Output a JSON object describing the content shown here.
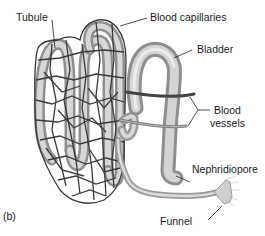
{
  "diagram": {
    "panel_label": "(b)",
    "labels": {
      "tubule": "Tubule",
      "blood_capillaries": "Blood capillaries",
      "bladder": "Bladder",
      "blood_vessels_line1": "Blood",
      "blood_vessels_line2": "vessels",
      "nephridiopore": "Nephridiopore",
      "funnel": "Funnel"
    },
    "colors": {
      "tube_fill": "#c8c8c8",
      "tube_shade": "#9a9a9a",
      "capillary": "#3a3a3a",
      "leader_line": "#222222",
      "text": "#1a1a1a",
      "background": "#ffffff"
    }
  }
}
